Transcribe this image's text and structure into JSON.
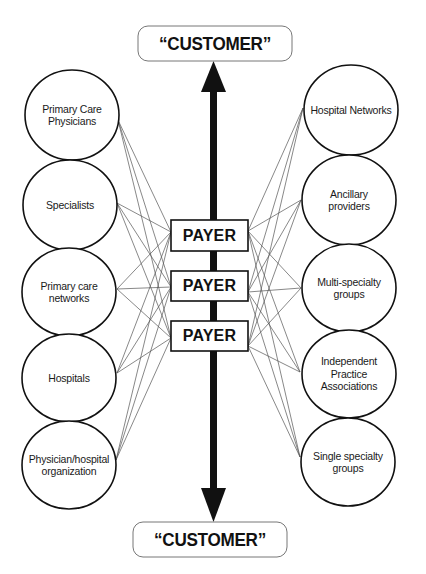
{
  "diagram": {
    "colors": {
      "stroke": "#111111",
      "connector": "#555555",
      "background": "#ffffff"
    },
    "customer_top": {
      "label": "“CUSTOMER”",
      "box": {
        "x": 138,
        "y": 26,
        "w": 154,
        "h": 35,
        "r": 10
      }
    },
    "customer_bottom": {
      "label": "“CUSTOMER”",
      "box": {
        "x": 133,
        "y": 522,
        "w": 154,
        "h": 35,
        "r": 10
      }
    },
    "arrow": {
      "x": 213.5,
      "top_tip": 61,
      "top_base": 92,
      "bottom_tip": 522,
      "bottom_base": 488,
      "shaft_width": 7,
      "head_width": 25
    },
    "payers": [
      {
        "label": "PAYER",
        "x": 171,
        "y": 220,
        "w": 77,
        "h": 31
      },
      {
        "label": "PAYER",
        "x": 171,
        "y": 271,
        "w": 77,
        "h": 30
      },
      {
        "label": "PAYER",
        "x": 171,
        "y": 321,
        "w": 77,
        "h": 30
      }
    ],
    "left_nodes": [
      {
        "label": "Primary Care\nPhysicians",
        "cx": 72,
        "cy": 115,
        "rx": 47,
        "ry": 45,
        "anchor": [
          118,
          120
        ]
      },
      {
        "label": "Specialists",
        "cx": 70,
        "cy": 205,
        "rx": 47,
        "ry": 45,
        "anchor": [
          117,
          203
        ]
      },
      {
        "label": "Primary care\nnetworks",
        "cx": 69,
        "cy": 292,
        "rx": 47,
        "ry": 44,
        "anchor": [
          117,
          289
        ]
      },
      {
        "label": "Hospitals",
        "cx": 69,
        "cy": 378,
        "rx": 47,
        "ry": 44,
        "anchor": [
          117,
          373
        ]
      },
      {
        "label": "Physician/hospital\norganization",
        "cx": 69,
        "cy": 465,
        "rx": 47,
        "ry": 44,
        "anchor": [
          116,
          460
        ]
      }
    ],
    "right_nodes": [
      {
        "label": "Hospital Networks",
        "cx": 351,
        "cy": 110,
        "rx": 47,
        "ry": 45,
        "anchor": [
          303,
          108
        ]
      },
      {
        "label": "Ancillary\nproviders",
        "cx": 349,
        "cy": 200,
        "rx": 47,
        "ry": 45,
        "anchor": [
          301,
          200
        ]
      },
      {
        "label": "Multi-specialty\ngroups",
        "cx": 349,
        "cy": 288,
        "rx": 47,
        "ry": 44,
        "anchor": [
          301,
          288
        ]
      },
      {
        "label": "Independent\nPractice\nAssociations",
        "cx": 349,
        "cy": 374,
        "rx": 47,
        "ry": 44,
        "anchor": [
          300,
          372
        ]
      },
      {
        "label": "Single specialty\ngroups",
        "cx": 348,
        "cy": 462,
        "rx": 47,
        "ry": 44,
        "anchor": [
          300,
          457
        ]
      }
    ],
    "payer_left_anchors": [
      [
        171,
        232
      ],
      [
        171,
        287
      ],
      [
        171,
        338
      ]
    ],
    "payer_right_anchors": [
      [
        248,
        231
      ],
      [
        248,
        292
      ],
      [
        248,
        346
      ]
    ]
  }
}
